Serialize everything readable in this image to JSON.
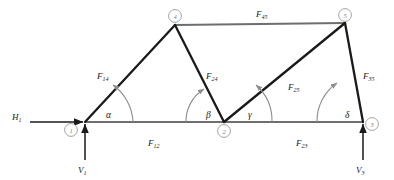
{
  "diagram": {
    "type": "truss-diagram",
    "colors": {
      "member_dark": "#1a1a1a",
      "member_light": "#6e6e6e",
      "node_circle": "#8c8c8c",
      "arc": "#8c8c8c",
      "force_arrow": "#1a1a1a",
      "background": "#ffffff"
    }
  },
  "nodes": [
    {
      "id": "node-1",
      "label": "1",
      "x": 85,
      "y": 122
    },
    {
      "id": "node-2",
      "label": "2",
      "x": 224,
      "y": 122
    },
    {
      "id": "node-3",
      "label": "3",
      "x": 363,
      "y": 122
    },
    {
      "id": "node-4",
      "label": "4",
      "x": 175,
      "y": 25
    },
    {
      "id": "node-5",
      "label": "5",
      "x": 345,
      "y": 23
    }
  ],
  "node_labels": {
    "n1": "1",
    "n2": "2",
    "n3": "3",
    "n4": "4",
    "n5": "5"
  },
  "members": [
    {
      "id": "member-12",
      "base": "F",
      "sub": "12",
      "from": "node-1",
      "to": "node-2",
      "style": "light"
    },
    {
      "id": "member-23",
      "base": "F",
      "sub": "23",
      "from": "node-2",
      "to": "node-3",
      "style": "light"
    },
    {
      "id": "member-45",
      "base": "F",
      "sub": "45",
      "from": "node-4",
      "to": "node-5",
      "style": "light"
    },
    {
      "id": "member-14",
      "base": "F",
      "sub": "14",
      "from": "node-1",
      "to": "node-4",
      "style": "dark"
    },
    {
      "id": "member-24",
      "base": "F",
      "sub": "24",
      "from": "node-2",
      "to": "node-4",
      "style": "dark"
    },
    {
      "id": "member-25",
      "base": "F",
      "sub": "25",
      "from": "node-2",
      "to": "node-5",
      "style": "dark"
    },
    {
      "id": "member-35",
      "base": "F",
      "sub": "35",
      "from": "node-3",
      "to": "node-5",
      "style": "dark"
    }
  ],
  "member_labels": {
    "F12": {
      "base": "F",
      "sub": "12",
      "x": 148,
      "y": 146
    },
    "F23": {
      "base": "F",
      "sub": "23",
      "x": 296,
      "y": 146
    },
    "F45": {
      "base": "F",
      "sub": "45",
      "x": 256,
      "y": 17
    },
    "F14": {
      "base": "F",
      "sub": "14",
      "x": 97,
      "y": 79
    },
    "F24": {
      "base": "F",
      "sub": "24",
      "x": 206,
      "y": 79
    },
    "F25": {
      "base": "F",
      "sub": "25",
      "x": 288,
      "y": 90
    },
    "F35": {
      "base": "F",
      "sub": "35",
      "x": 363,
      "y": 79
    }
  },
  "angles": [
    {
      "id": "angle-alpha",
      "symbol": "α",
      "at": "node-1",
      "x": 106,
      "y": 118
    },
    {
      "id": "angle-beta",
      "symbol": "β",
      "at": "node-2",
      "x": 206,
      "y": 118
    },
    {
      "id": "angle-gamma",
      "symbol": "γ",
      "at": "node-2",
      "x": 248,
      "y": 118
    },
    {
      "id": "angle-delta",
      "symbol": "δ",
      "at": "node-3",
      "x": 345,
      "y": 118
    }
  ],
  "forces": [
    {
      "id": "force-H1",
      "base": "H",
      "sub": "1",
      "x": 16,
      "y": 120,
      "direction": "right",
      "at": "node-1"
    },
    {
      "id": "force-V1",
      "base": "V",
      "sub": "1",
      "x": 78,
      "y": 172,
      "direction": "up",
      "at": "node-1"
    },
    {
      "id": "force-V3",
      "base": "V",
      "sub": "3",
      "x": 356,
      "y": 172,
      "direction": "up",
      "at": "node-3"
    }
  ],
  "force_labels": {
    "H1": {
      "base": "H",
      "sub": "1"
    },
    "V1": {
      "base": "V",
      "sub": "1"
    },
    "V3": {
      "base": "V",
      "sub": "3"
    }
  }
}
